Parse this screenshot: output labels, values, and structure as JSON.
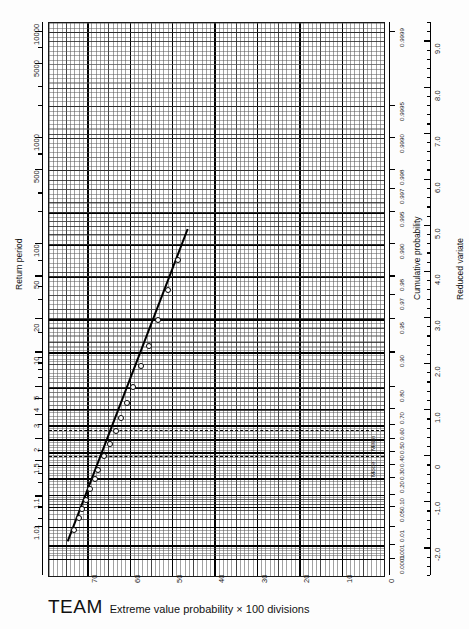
{
  "sheet": {
    "brand": "TEAM",
    "footer_text": "Extreme value probability × 100 divisions"
  },
  "axes": {
    "return_period": {
      "title": "Return period",
      "labels": [
        "1.01",
        "1.1",
        "1.5",
        "2",
        "3",
        "4",
        "5",
        "10",
        "20",
        "50",
        "100",
        "500",
        "1000",
        "5000",
        "10000"
      ]
    },
    "cumulative_probability": {
      "title": "Cumulative probability",
      "labels": [
        "0.0001",
        "0.001",
        "0.01",
        "0.05",
        "0.10",
        "0.20",
        "0.30",
        "0.40",
        "0.50",
        "0.60",
        "0.70",
        "0.80",
        "0.90",
        "0.95",
        "0.97",
        "0.98",
        "0.990",
        "0.995",
        "0.997",
        "0.998",
        "0.9990",
        "0.9995",
        "0.9999"
      ]
    },
    "reduced_variate": {
      "title": "Reduced variate",
      "labels": [
        "-2.0",
        "-1.0",
        "0",
        "1.0",
        "2.0",
        "3.0",
        "4.0",
        "5.0",
        "6.0",
        "7.0",
        "8.0",
        "9.0"
      ]
    },
    "divisions": {
      "labels": [
        "0",
        "10",
        "20",
        "30",
        "40",
        "50",
        "60",
        "70"
      ]
    }
  },
  "reference_lines": [
    {
      "label": "Mode",
      "reduced_variate": 0.0
    },
    {
      "label": "Mean",
      "reduced_variate": 0.577
    }
  ],
  "chart_data": {
    "type": "scatter",
    "xlabel": "Extreme value probability × 100 divisions",
    "ylabel": "Return period",
    "y2label": "Cumulative probability",
    "y3label": "Reduced variate",
    "grid": true,
    "legend": "none",
    "ylim_reduced_variate": [
      -2.6,
      9.4
    ],
    "xlim_divisions": [
      0,
      79
    ],
    "series": [
      {
        "name": "plotted observations",
        "marker": "open-circle",
        "x_divisions": [
          73.3,
          72.2,
          71.4,
          70.5,
          69.6,
          68.5,
          67.6,
          66.2,
          64.9,
          63.5,
          62.2,
          60.8,
          59.4,
          57.5,
          55.7,
          53.6,
          51.2,
          48.9
        ],
        "reduced_variate": [
          -1.57,
          -1.32,
          -1.12,
          -0.92,
          -0.7,
          -0.47,
          -0.27,
          0.02,
          0.28,
          0.56,
          0.86,
          1.18,
          1.53,
          1.97,
          2.42,
          2.98,
          3.62,
          4.28
        ]
      },
      {
        "name": "fitted line",
        "type": "line",
        "x_divisions": [
          74.6,
          46.3
        ],
        "reduced_variate": [
          -1.85,
          4.93
        ]
      }
    ]
  }
}
